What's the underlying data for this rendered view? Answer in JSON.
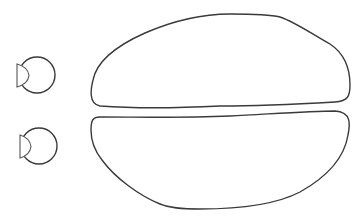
{
  "diagram": {
    "type": "line-drawing",
    "background": "#ffffff",
    "stroke_color": "#3a3a3a",
    "elements": [
      {
        "id": "small-knob-top",
        "shape": "circle-with-d-segment",
        "cx": 37,
        "cy": 75,
        "r": 18
      },
      {
        "id": "small-knob-bottom",
        "shape": "circle-with-d-segment",
        "cx": 39,
        "cy": 146,
        "r": 18
      },
      {
        "id": "large-shape-top",
        "shape": "dome"
      },
      {
        "id": "large-shape-bottom",
        "shape": "inverted-dome"
      }
    ]
  }
}
